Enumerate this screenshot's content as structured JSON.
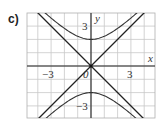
{
  "panel_label": "c)",
  "chart_data": {
    "type": "line",
    "title": "",
    "xlabel": "x",
    "ylabel": "y",
    "xlim": [
      -4.8,
      4.8
    ],
    "ylim": [
      -4,
      4
    ],
    "grid": true,
    "x_tick_labels": [
      {
        "value": -3,
        "label": "−3"
      },
      {
        "value": 3,
        "label": "3"
      }
    ],
    "y_tick_labels": [
      {
        "value": 3,
        "label": "3"
      },
      {
        "value": -3,
        "label": "−3"
      }
    ],
    "origin_label": "0",
    "series": [
      {
        "name": "hyperbola upper branch",
        "equation": "y^2/4 - x^2/4 = 1, y>0",
        "vertex": [
          0,
          2
        ]
      },
      {
        "name": "hyperbola lower branch",
        "equation": "y^2/4 - x^2/4 = 1, y<0",
        "vertex": [
          0,
          -2
        ]
      },
      {
        "name": "asymptote",
        "equation": "y = x"
      },
      {
        "name": "asymptote",
        "equation": "y = -x"
      }
    ]
  }
}
